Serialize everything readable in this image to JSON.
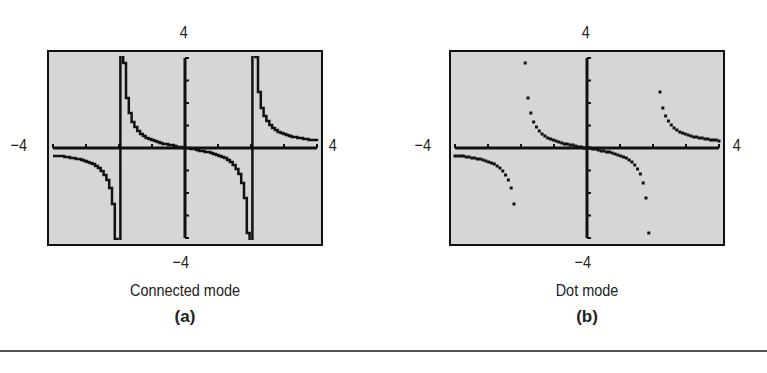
{
  "figure": {
    "panels": [
      {
        "id": "a",
        "mode_label": "Connected mode",
        "sub_label": "(a)",
        "ymax_label": "4",
        "ymin_label": "−4",
        "xmin_label": "−4",
        "xmax_label": "4"
      },
      {
        "id": "b",
        "mode_label": "Dot mode",
        "sub_label": "(b)",
        "ymax_label": "4",
        "ymin_label": "−4",
        "xmin_label": "−4",
        "xmax_label": "4"
      }
    ],
    "colors": {
      "screen_bg": "#d6d6d6",
      "ink": "#111111",
      "rule": "#555555"
    }
  },
  "chart_data": [
    {
      "type": "line",
      "title": "Connected mode",
      "panel": "(a)",
      "function": "y = x/(x^2 - 4)",
      "xlim": [
        -4,
        4
      ],
      "ylim": [
        -4,
        4
      ],
      "xscale_ticks": 1,
      "yscale_ticks": 1,
      "vertical_asymptotes": [
        -2,
        2
      ],
      "connected_artifact_lines_at_x": [
        -2,
        2
      ],
      "x": [
        -4,
        -3.5,
        -3,
        -2.5,
        -2.2,
        -1.8,
        -1.5,
        -1,
        -0.5,
        0,
        0.5,
        1,
        1.5,
        1.8,
        2.2,
        2.5,
        3,
        3.5,
        4
      ],
      "y": [
        -0.33,
        -0.42,
        -0.6,
        -1.11,
        -2.62,
        2.37,
        0.86,
        0.33,
        0.13,
        0,
        -0.13,
        -0.33,
        -0.86,
        -2.37,
        2.62,
        1.11,
        0.6,
        0.42,
        0.33
      ],
      "xlabel": "",
      "ylabel": "",
      "grid": false
    },
    {
      "type": "scatter",
      "title": "Dot mode",
      "panel": "(b)",
      "function": "y = x/(x^2 - 4)",
      "xlim": [
        -4,
        4
      ],
      "ylim": [
        -4,
        4
      ],
      "xscale_ticks": 1,
      "yscale_ticks": 1,
      "vertical_asymptotes": [
        -2,
        2
      ],
      "x": [
        -4,
        -3.5,
        -3,
        -2.5,
        -2.2,
        -1.8,
        -1.5,
        -1,
        -0.5,
        0,
        0.5,
        1,
        1.5,
        1.8,
        2.2,
        2.5,
        3,
        3.5,
        4
      ],
      "y": [
        -0.33,
        -0.42,
        -0.6,
        -1.11,
        -2.62,
        2.37,
        0.86,
        0.33,
        0.13,
        0,
        -0.13,
        -0.33,
        -0.86,
        -2.37,
        2.62,
        1.11,
        0.6,
        0.42,
        0.33
      ],
      "xlabel": "",
      "ylabel": "",
      "grid": false
    }
  ]
}
